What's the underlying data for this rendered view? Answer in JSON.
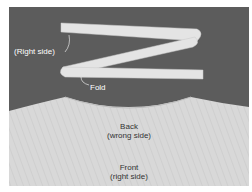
{
  "image": {
    "description": "Photo of a folded fabric strip (binding) laid above a garment neckline",
    "colors": {
      "background": "#5c5c5c",
      "fabric": "#dcdcdc",
      "strip": "#e6e6e6"
    }
  },
  "labels": {
    "strip_right_side": "(Right side)",
    "fold": "Fold",
    "back_line1": "Back",
    "back_line2": "(wrong side)",
    "front_line1": "Front",
    "front_line2": "(right side)"
  }
}
